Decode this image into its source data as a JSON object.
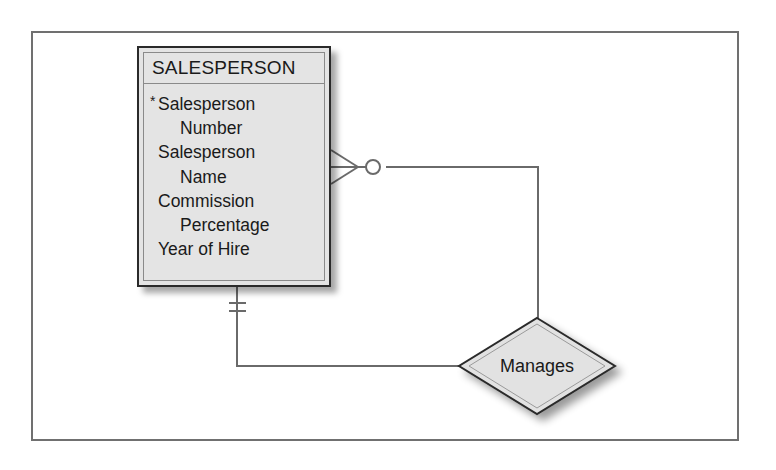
{
  "diagram": {
    "type": "entity-relationship",
    "entity": {
      "name": "SALESPERSON",
      "primary_key_marker": "*",
      "attributes": [
        {
          "name": "Salesperson Number",
          "lines": [
            "Salesperson",
            "Number"
          ],
          "primary_key": true
        },
        {
          "name": "Salesperson Name",
          "lines": [
            "Salesperson",
            "Name"
          ],
          "primary_key": false
        },
        {
          "name": "Commission Percentage",
          "lines": [
            "Commission",
            "Percentage"
          ],
          "primary_key": false
        },
        {
          "name": "Year of Hire",
          "lines": [
            "Year of Hire"
          ],
          "primary_key": false
        }
      ]
    },
    "relationship": {
      "name": "Manages",
      "kind": "unary (recursive)",
      "end_one": {
        "symbol": "mandatory-one",
        "notation": "double bar"
      },
      "end_many": {
        "symbol": "optional-many",
        "notation": "crow's foot with circle"
      }
    },
    "colors": {
      "entity_fill": "#e4e4e4",
      "diamond_fill": "#e2e2e2",
      "line": "#6a6a6a",
      "frame": "#707070",
      "outline": "#2a2a2a"
    }
  }
}
